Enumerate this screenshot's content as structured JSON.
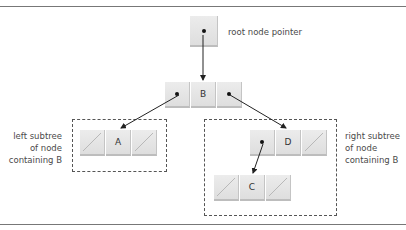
{
  "diagram": {
    "type": "binary-search-tree",
    "root_pointer": {
      "label": "root node pointer",
      "points_to": "B"
    },
    "nodes": [
      {
        "id": "B",
        "value": "B",
        "left": "A",
        "right": "D"
      },
      {
        "id": "A",
        "value": "A",
        "left": null,
        "right": null
      },
      {
        "id": "D",
        "value": "D",
        "left": "C",
        "right": null
      },
      {
        "id": "C",
        "value": "C",
        "left": null,
        "right": null
      }
    ],
    "annotations": {
      "left_subtree": {
        "lines": [
          "left subtree",
          "of node",
          "containing B"
        ]
      },
      "right_subtree": {
        "lines": [
          "right subtree",
          "of node",
          "containing B"
        ]
      }
    },
    "colors": {
      "rule": "#777777",
      "node_fill": "#e4e4e4",
      "text": "#4a4a4a",
      "arrow": "#222222",
      "dashed_border": "#555555"
    }
  }
}
